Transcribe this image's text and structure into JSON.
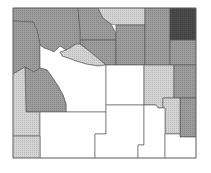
{
  "map": {
    "region": "Wyoming counties",
    "palette": {
      "none": "#ffffff",
      "low": "#d4d4d4",
      "medium": "#9c9c9c",
      "high": "#8a8a8a",
      "very_high": "#4a4a4a",
      "border": "#555555"
    },
    "counties": [
      {
        "name": "Park",
        "class": "medium",
        "points": "13,8 78,8 80,30 88,50 82,48 76,44 70,48 66,50 60,46 54,52 50,50 44,48 40,45 37,30 33,22 13,21"
      },
      {
        "name": "Teton",
        "class": "medium",
        "points": "13,21 33,22 37,30 40,45 40,68 34,72 25,67 13,74"
      },
      {
        "name": "Big Horn",
        "class": "medium",
        "points": "78,8 98,8 103,18 111,24 116,33 116,40 80,40 80,30"
      },
      {
        "name": "Sheridan",
        "class": "low",
        "points": "98,8 145,8 145,25 116,25 111,24 103,18"
      },
      {
        "name": "Washakie",
        "class": "medium",
        "points": "80,40 116,40 116,65 106,65 100,60 94,55 88,50 80,44"
      },
      {
        "name": "Johnson",
        "class": "medium",
        "points": "116,25 145,25 145,65 116,65"
      },
      {
        "name": "Hot Springs",
        "class": "low",
        "points": "66,50 70,48 76,44 80,44 88,50 94,55 100,60 106,65 98,66 86,64 76,61 68,58 62,56 60,52"
      },
      {
        "name": "Crook",
        "class": "medium",
        "points": "145,8 170,8 170,65 145,65"
      },
      {
        "name": "Weston",
        "class": "very_high",
        "points": "170,8 196,8 196,40 170,40"
      },
      {
        "name": "Campbell",
        "class": "medium",
        "points": "170,40 196,40 196,65 170,65"
      },
      {
        "name": "Fremont",
        "class": "none",
        "points": "40,45 44,48 50,50 54,52 60,46 66,50 60,52 62,56 68,58 76,61 86,64 98,66 106,65 106,112 66,112 66,104 63,95 58,86 52,77 47,70 40,68"
      },
      {
        "name": "Sublette",
        "class": "medium",
        "points": "25,67 34,72 40,68 47,70 52,77 58,86 63,95 66,104 66,112 26,112"
      },
      {
        "name": "Lincoln",
        "class": "low",
        "points": "13,74 25,67 26,112 40,112 40,136 13,136"
      },
      {
        "name": "Natrona",
        "class": "none",
        "points": "106,65 144,65 144,105 106,105"
      },
      {
        "name": "Converse",
        "class": "low",
        "points": "144,65 174,65 174,98 163,98 163,108 158,108 156,105 144,105"
      },
      {
        "name": "Niobrara",
        "class": "medium",
        "points": "174,65 196,65 196,98 174,98"
      },
      {
        "name": "Goshen",
        "class": "medium",
        "points": "180,98 196,98 196,137 180,137"
      },
      {
        "name": "Platte",
        "class": "low",
        "points": "163,98 180,98 180,134 165,134 165,108 163,108"
      },
      {
        "name": "Sweetwater",
        "class": "none",
        "points": "40,112 106,112 106,134 95,134 95,158 40,158"
      },
      {
        "name": "Uinta",
        "class": "low",
        "points": "13,136 40,136 40,158 13,158"
      },
      {
        "name": "Carbon",
        "class": "none",
        "points": "106,105 144,105 144,145 138,145 138,158 95,158 95,134 106,134"
      },
      {
        "name": "Albany",
        "class": "none",
        "points": "144,105 156,105 158,108 163,108 165,108 165,158 138,158 138,145 144,145"
      },
      {
        "name": "Laramie",
        "class": "none",
        "points": "165,134 180,134 180,137 196,137 196,158 165,158"
      }
    ]
  }
}
